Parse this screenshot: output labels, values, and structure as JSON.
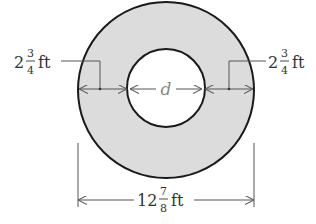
{
  "diagram": {
    "type": "annulus-dimensioned",
    "colors": {
      "ring_fill": "#dcdcdc",
      "stroke": "#1a1a1a",
      "dimension_line": "#555555",
      "label_text": "#333333",
      "inner_label_text": "#888888",
      "background": "#ffffff"
    },
    "outer_circle": {
      "cx": 166,
      "cy": 90,
      "r": 88
    },
    "inner_circle": {
      "cx": 166,
      "cy": 88,
      "r": 39
    },
    "labels": {
      "left_width": {
        "whole": "2",
        "numerator": "3",
        "denominator": "4",
        "unit": "ft"
      },
      "right_width": {
        "whole": "2",
        "numerator": "3",
        "denominator": "4",
        "unit": "ft"
      },
      "inner_diameter": {
        "text": "d"
      },
      "outer_diameter": {
        "whole": "12",
        "numerator": "7",
        "denominator": "8",
        "unit": "ft"
      }
    }
  }
}
